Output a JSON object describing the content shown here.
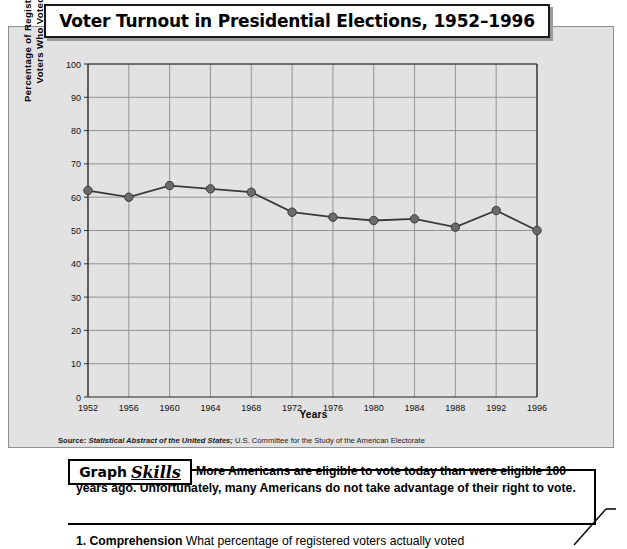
{
  "title": "Voter Turnout in Presidential Elections, 1952–1996",
  "chart_data": {
    "type": "line",
    "title": "Voter Turnout in Presidential Elections, 1952–1996",
    "xlabel": "Years",
    "ylabel": "Percentage of Registered Voters Who Voted",
    "ylabel_line1": "Percentage of Registered",
    "ylabel_line2": "Voters Who Voted",
    "categories": [
      "1952",
      "1956",
      "1960",
      "1964",
      "1968",
      "1972",
      "1976",
      "1980",
      "1984",
      "1988",
      "1992",
      "1996"
    ],
    "values": [
      62,
      60,
      63.5,
      62.5,
      61.5,
      55.5,
      54,
      53,
      53.5,
      51,
      56,
      50
    ],
    "ylim": [
      0,
      100
    ],
    "yticks": [
      "0",
      "10",
      "20",
      "30",
      "40",
      "50",
      "60",
      "70",
      "80",
      "90",
      "100"
    ],
    "grid": true,
    "legend": "none",
    "marker": "circle",
    "line_color": "#3a3a3a",
    "marker_color": "#6b6b6b",
    "plot_background": "#e2e2e2",
    "grid_color": "#8a8a8a"
  },
  "source": {
    "label": "Source:",
    "italic_part": "Statistical Abstract of the United States;",
    "rest": " U.S. Committee for the Study of the American Electorate"
  },
  "skills": {
    "tag_word1": "Graph",
    "tag_word2": "Skills",
    "intro": "More Americans are eligible to vote today than were eligible 100 years ago. Unfortunately, many Americans do not take advantage of their right to vote.",
    "question_number": "1.",
    "question_label": "Comprehension",
    "question_text": "What percentage of registered voters actually voted"
  }
}
